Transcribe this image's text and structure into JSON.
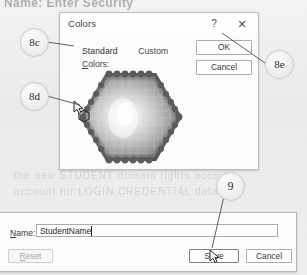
{
  "page": {
    "background_color": "#efefef",
    "ghost_top_text": "Name: Enter Security",
    "ghost_lines": [
      "the new STUDENT domain rights account",
      "account  for  LOGIN  CREDENTIAL  data"
    ]
  },
  "colors_dialog": {
    "title": "Colors",
    "help_button": "?",
    "close_button": "✕",
    "tabs": [
      {
        "label": "Standard",
        "active": true
      },
      {
        "label": "Custom",
        "active": false
      }
    ],
    "colors_label": "Colors:",
    "colors_label_accel": "C",
    "ok_button": "OK",
    "cancel_button": "Cancel",
    "palette": {
      "type": "hexagon-honeycomb",
      "rendering": "grayscale",
      "selected_swatch_position": "left-edge"
    }
  },
  "save_dialog": {
    "name_label": "Name:",
    "name_label_accel": "N",
    "name_value": "StudentName",
    "name_placeholder": "",
    "reset_button": "Reset",
    "reset_button_accel": "R",
    "reset_enabled": false,
    "save_button": "Save",
    "cancel_button": "Cancel"
  },
  "callouts": [
    {
      "id": "8c",
      "label": "8c",
      "points_to": "standard-tab"
    },
    {
      "id": "8d",
      "label": "8d",
      "points_to": "color-swatch"
    },
    {
      "id": "8e",
      "label": "8e",
      "points_to": "ok-button"
    },
    {
      "id": "9",
      "label": "9",
      "points_to": "save-button"
    }
  ],
  "colors": {
    "dialog_bg": "#fbfbfb",
    "dialog_border": "#b9bcc0",
    "text": "#3f444a",
    "button_border": "#a9adb2",
    "disabled_text": "#a6aaae"
  }
}
